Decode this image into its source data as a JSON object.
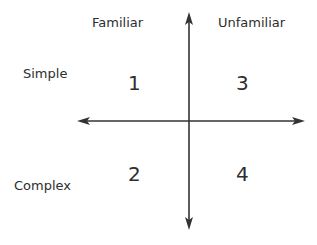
{
  "diagram": {
    "type": "2x2 quadrant matrix",
    "column_headers": [
      {
        "label": "Familiar"
      },
      {
        "label": "Unfamiliar"
      }
    ],
    "row_headers": [
      {
        "label": "Simple"
      },
      {
        "label": "Complex"
      }
    ],
    "quadrants": [
      {
        "label": "1",
        "row": "Simple",
        "column": "Familiar"
      },
      {
        "label": "3",
        "row": "Simple",
        "column": "Unfamiliar"
      },
      {
        "label": "2",
        "row": "Complex",
        "column": "Familiar"
      },
      {
        "label": "4",
        "row": "Complex",
        "column": "Unfamiliar"
      }
    ],
    "axes": {
      "horizontal": {
        "arrows": "both ends"
      },
      "vertical": {
        "arrows": "both ends"
      },
      "color": "#333333"
    }
  }
}
